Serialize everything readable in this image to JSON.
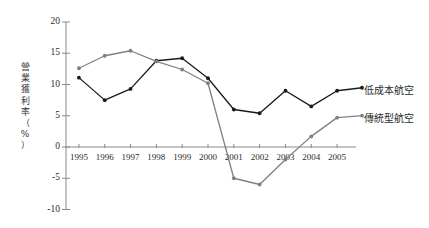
{
  "chart_data": {
    "type": "line",
    "title": "",
    "xlabel": "",
    "ylabel": "營業獲利率（%）",
    "categories": [
      "1995",
      "1996",
      "1997",
      "1998",
      "1999",
      "2000",
      "2001",
      "2002",
      "2003",
      "2004",
      "2005"
    ],
    "ylim": [
      -10,
      20
    ],
    "yticks": [
      20,
      15,
      10,
      5,
      0,
      -5,
      -10
    ],
    "ytick_labels": [
      "20",
      "15",
      "10",
      "5",
      "0",
      "-5",
      "-10"
    ],
    "grid": false,
    "legend_position": "right-inline",
    "series": [
      {
        "name": "低成本航空",
        "color": "#1a1a1a",
        "marker": "circle",
        "values": [
          11.1,
          7.5,
          9.3,
          13.8,
          14.2,
          11.0,
          6.0,
          5.4,
          9.0,
          6.5,
          9.0
        ]
      },
      {
        "name": "傳統型航空",
        "color": "#808080",
        "marker": "circle",
        "values": [
          12.6,
          14.6,
          15.4,
          13.7,
          12.4,
          10.2,
          -5.0,
          -6.0,
          -2.0,
          1.7,
          4.7
        ]
      }
    ]
  },
  "axis": {
    "y_title_chars": [
      "營",
      "業",
      "獲",
      "利",
      "率",
      "（",
      "%",
      "）"
    ],
    "axis_color": "#8a8a8a"
  },
  "legend": {
    "low_cost_label": "低成本航空",
    "legacy_label": "傳統型航空"
  }
}
